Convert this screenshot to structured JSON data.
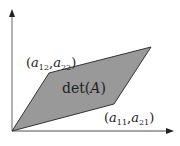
{
  "diagram": {
    "colors": {
      "axis": "#8a8a8a",
      "arrow": "#222222",
      "fill": "#999999",
      "edge": "#333333",
      "text": "#222222"
    },
    "origin": {
      "x": 12,
      "y": 131
    },
    "vertices": {
      "origin": [
        12,
        131
      ],
      "v1": [
        114,
        104
      ],
      "v1_plus_v2": [
        151,
        47
      ],
      "v2": [
        49,
        73
      ]
    },
    "labels": {
      "v2": {
        "open": "(",
        "var1": "a",
        "sub1": "12",
        "sep": ",",
        "var2": "a",
        "sub2": "22",
        "close": ")"
      },
      "v1": {
        "open": "(",
        "var1": "a",
        "sub1": "11",
        "sep": ",",
        "var2": "a",
        "sub2": "21",
        "close": ")"
      },
      "area": {
        "fn": "det(",
        "arg": "A",
        "close": ")"
      }
    },
    "axes": {
      "x": {
        "from": [
          12,
          131
        ],
        "to": [
          172,
          131
        ]
      },
      "y": {
        "from": [
          12,
          131
        ],
        "to": [
          12,
          10
        ]
      }
    }
  }
}
